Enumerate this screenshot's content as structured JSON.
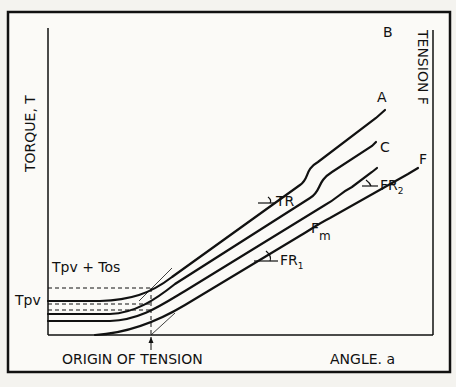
{
  "diagram": {
    "y_axis_label": "TORQUE, T",
    "right_axis_label": "TENSION F",
    "x_axis_left_label": "ORIGIN OF TENSION",
    "x_axis_right_label": "ANGLE. a",
    "level_labels": {
      "tpv": "Tpv",
      "tpv_tos": "Tpv + Tos"
    },
    "curves": [
      {
        "id": "B",
        "label": "B"
      },
      {
        "id": "A",
        "label": "A"
      },
      {
        "id": "C",
        "label": "C"
      },
      {
        "id": "F",
        "label": "F"
      }
    ],
    "annotations": {
      "tr": "TR",
      "fm_main": "F",
      "fm_sub": "m",
      "fr1_main": "FR",
      "fr1_sub": "1",
      "fr2_main": "FR",
      "fr2_sub": "2"
    },
    "colors": {
      "ink": "#111111",
      "paper": "#f4f3ef"
    }
  }
}
